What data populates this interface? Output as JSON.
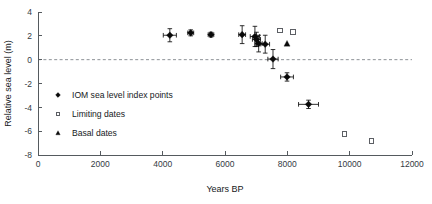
{
  "chart_data": {
    "type": "scatter",
    "title": "",
    "xlabel": "Years BP",
    "ylabel": "Relative sea level (m)",
    "xlim": [
      0,
      12000
    ],
    "ylim": [
      -8,
      4
    ],
    "xticks": [
      0,
      2000,
      4000,
      6000,
      8000,
      10000,
      12000
    ],
    "yticks": [
      4,
      2,
      0,
      -2,
      -4,
      -6,
      -8
    ],
    "xticklabels": [
      "0",
      "2000",
      "4000",
      "6000",
      "8000",
      "10000",
      "12000"
    ],
    "yticklabels": [
      "4",
      "2",
      "0",
      "-2",
      "-4",
      "-6",
      "-8"
    ],
    "grid": false,
    "legend_position": "inside-lower-left",
    "reference_lines": [
      {
        "name": "zero-sea-level",
        "axis": "y",
        "value": 0,
        "style": "dashed",
        "color": "#8d9196"
      }
    ],
    "series": [
      {
        "name": "IOM sea level index points",
        "key": "index_points",
        "marker": "filled-diamond",
        "color": "#090909",
        "points": [
          {
            "x": 4230,
            "y": 2.05,
            "xerr": 210,
            "yerr": 0.55
          },
          {
            "x": 4900,
            "y": 2.25,
            "xerr": 95,
            "yerr": 0.25
          },
          {
            "x": 5550,
            "y": 2.1,
            "xerr": 90,
            "yerr": 0.2
          },
          {
            "x": 6550,
            "y": 2.1,
            "xerr": 110,
            "yerr": 0.75
          },
          {
            "x": 6960,
            "y": 1.95,
            "xerr": 150,
            "yerr": 0.85
          },
          {
            "x": 7010,
            "y": 1.7,
            "xerr": 130,
            "yerr": 0.6
          },
          {
            "x": 7080,
            "y": 1.35,
            "xerr": 115,
            "yerr": 0.7
          },
          {
            "x": 7290,
            "y": 1.3,
            "xerr": 140,
            "yerr": 0.75
          },
          {
            "x": 7540,
            "y": 0.05,
            "xerr": 165,
            "yerr": 0.8
          },
          {
            "x": 7990,
            "y": -1.45,
            "xerr": 205,
            "yerr": 0.35
          },
          {
            "x": 8680,
            "y": -3.75,
            "xerr": 320,
            "yerr": 0.35
          }
        ]
      },
      {
        "name": "Limiting dates",
        "key": "limiting_dates",
        "marker": "open-square",
        "color": "#4a4e53",
        "points": [
          {
            "x": 7760,
            "y": 2.45
          },
          {
            "x": 8180,
            "y": 2.3
          },
          {
            "x": 9840,
            "y": -6.25
          },
          {
            "x": 10700,
            "y": -6.8
          }
        ]
      },
      {
        "name": "Basal dates",
        "key": "basal_dates",
        "marker": "filled-triangle",
        "color": "#090909",
        "points": [
          {
            "x": 7990,
            "y": 1.35
          }
        ]
      }
    ]
  },
  "legend": {
    "entries": [
      {
        "label": "IOM sea level index points",
        "marker": "filled-diamond"
      },
      {
        "label": "Limiting dates",
        "marker": "open-square"
      },
      {
        "label": "Basal dates",
        "marker": "filled-triangle"
      }
    ]
  }
}
